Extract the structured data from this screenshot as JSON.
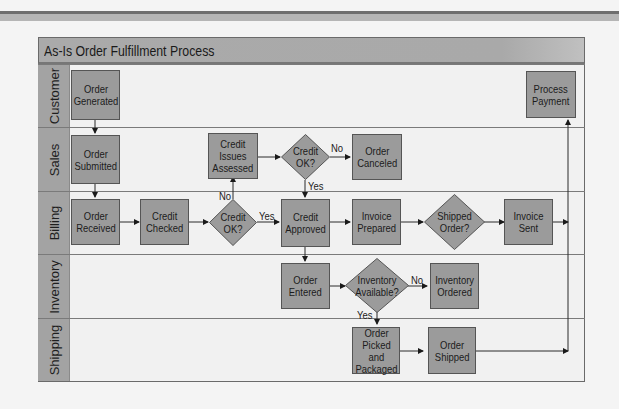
{
  "title": "As-Is Order Fulfillment Process",
  "lanes": [
    {
      "label": "Customer"
    },
    {
      "label": "Sales"
    },
    {
      "label": "Billing"
    },
    {
      "label": "Inventory"
    },
    {
      "label": "Shipping"
    }
  ],
  "nodes": {
    "order_generated": "Order\nGenerated",
    "process_payment": "Process\nPayment",
    "order_submitted": "Order\nSubmitted",
    "credit_issues_assessed": "Credit\nIssues\nAssessed",
    "credit_ok_sales": "Credit\nOK?",
    "order_canceled": "Order\nCanceled",
    "order_received": "Order\nReceived",
    "credit_checked": "Credit\nChecked",
    "credit_ok_billing": "Credit\nOK?",
    "credit_approved": "Credit\nApproved",
    "invoice_prepared": "Invoice\nPrepared",
    "shipped_order": "Shipped\nOrder?",
    "invoice_sent": "Invoice\nSent",
    "order_entered": "Order\nEntered",
    "inventory_available": "Inventory\nAvailable?",
    "inventory_ordered": "Inventory\nOrdered",
    "order_picked_packaged": "Order\nPicked and\nPackaged",
    "order_shipped": "Order\nShipped"
  },
  "edge_labels": {
    "sales_no": "No",
    "sales_yes": "Yes",
    "billing_no": "No",
    "billing_yes": "Yes",
    "inventory_no": "No",
    "inventory_yes": "Yes"
  },
  "colors": {
    "box_fill": "#9b9b9b",
    "lane_bg": "#f1f1f1",
    "lane_label_bg": "#a3a3a3",
    "header_bg": "#aaaaaa"
  }
}
